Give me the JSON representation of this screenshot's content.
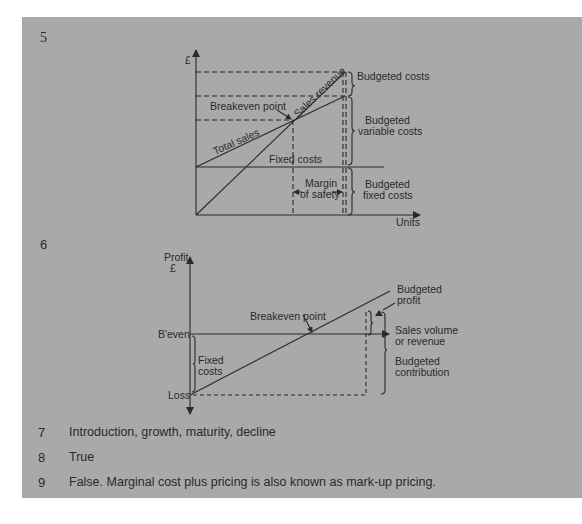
{
  "questions": [
    {
      "number": "5",
      "type": "diagram",
      "diagram": "breakeven_chart"
    },
    {
      "number": "6",
      "type": "diagram",
      "diagram": "profit_volume_chart"
    },
    {
      "number": "7",
      "answer": "Introduction, growth, maturity, decline"
    },
    {
      "number": "8",
      "answer": "True"
    },
    {
      "number": "9",
      "answer": "False. Marginal cost plus pricing is also known as mark-up pricing."
    }
  ],
  "breakeven_chart": {
    "y_axis_label": "£",
    "x_axis_label": "Units",
    "labels": {
      "breakeven_point": "Breakeven point",
      "sales_revenue": "Sales revenue",
      "total_sales": "Total sales",
      "fixed_costs": "Fixed costs",
      "margin_of_safety_1": "Margin",
      "margin_of_safety_2": "of safety",
      "budgeted_costs": "Budgeted costs",
      "budgeted_variable_costs_1": "Budgeted",
      "budgeted_variable_costs_2": "variable costs",
      "budgeted_fixed_costs_1": "Budgeted",
      "budgeted_fixed_costs_2": "fixed costs"
    }
  },
  "profit_volume_chart": {
    "y_axis_label_1": "Profit",
    "y_axis_label_2": "£",
    "labels": {
      "beven": "B'even",
      "loss": "Loss",
      "fixed_costs_1": "Fixed",
      "fixed_costs_2": "costs",
      "breakeven_point": "Breakeven point",
      "budgeted_profit_1": "Budgeted",
      "budgeted_profit_2": "profit",
      "sales_volume_1": "Sales volume",
      "sales_volume_2": "or revenue",
      "budgeted_contribution_1": "Budgeted",
      "budgeted_contribution_2": "contribution"
    }
  },
  "colors": {
    "panel": "#a9a9a9",
    "ink": "#2a2a2a",
    "page": "#ffffff"
  }
}
